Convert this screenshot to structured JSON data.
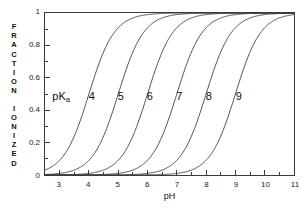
{
  "chart_data": {
    "type": "line",
    "title": "",
    "subtitle": "",
    "xlabel": "pH",
    "ylabel": "FRACTION IONIZED",
    "xlim": [
      2.5,
      11
    ],
    "ylim": [
      0,
      1
    ],
    "grid": false,
    "legend_position": "inline-curve-labels",
    "x_ticks": [
      3,
      4,
      5,
      6,
      7,
      8,
      9,
      10,
      11
    ],
    "x_tick_labels": [
      "3",
      "4",
      "5",
      "6",
      "7",
      "8",
      "9",
      "10",
      "11"
    ],
    "x_minor_tick_step": 0.5,
    "y_ticks": [
      0,
      0.2,
      0.4,
      0.6,
      0.8,
      1
    ],
    "y_tick_labels": [
      "0",
      "0.2",
      "0.4",
      "0.6",
      "0.8",
      "1"
    ],
    "y_minor_tick_step": 0.1,
    "equation": "fraction ionized = 1 / (1 + 10^(pKa - pH))",
    "series": [
      {
        "name": "4",
        "pka": 4,
        "label": "4",
        "label_x": 4.12,
        "label_y": 0.49
      },
      {
        "name": "5",
        "pka": 5,
        "label": "5",
        "label_x": 5.1,
        "label_y": 0.49
      },
      {
        "name": "6",
        "pka": 6,
        "label": "6",
        "label_x": 6.08,
        "label_y": 0.49
      },
      {
        "name": "7",
        "pka": 7,
        "label": "7",
        "label_x": 7.08,
        "label_y": 0.49
      },
      {
        "name": "8",
        "pka": 8,
        "label": "8",
        "label_x": 8.08,
        "label_y": 0.49
      },
      {
        "name": "9",
        "pka": 9,
        "label": "9",
        "label_x": 9.1,
        "label_y": 0.49
      }
    ],
    "annotations": [
      {
        "name": "pka-label",
        "text": "pKa",
        "base": "pK",
        "sub": "a",
        "x": 3.08,
        "y": 0.49
      }
    ],
    "line_color": "#3a3a3a",
    "axis_color": "#3a3a3a",
    "background_color": "#ffffff",
    "text_color": "#111111"
  },
  "axes": {
    "x_title": "pH",
    "y_title_lines": [
      "F",
      "R",
      "A",
      "C",
      "T",
      "I",
      "O",
      "N"
    ],
    "y_title_lines_2": [
      "I",
      "O",
      "N",
      "I",
      "Z",
      "E",
      "D"
    ]
  }
}
